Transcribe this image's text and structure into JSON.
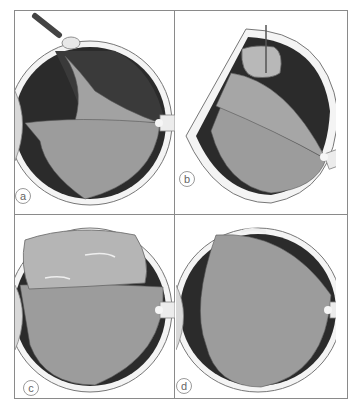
{
  "figure": {
    "panels": [
      {
        "id": "a",
        "label": "a",
        "description": "Pneumatic retinopexy: gas injection with cryo probe at superior retinal break, detached retina"
      },
      {
        "id": "b",
        "label": "b",
        "description": "Needle injecting gas bubble into vitreous cavity, retina detached"
      },
      {
        "id": "c",
        "label": "c",
        "description": "Large gas bubble tamponading superior break, retina reattaching"
      },
      {
        "id": "d",
        "label": "d",
        "description": "Retina reattached; small residual scar at superior break"
      }
    ],
    "colors": {
      "frame": "#8a8a8a",
      "sclera": "#f2f2f2",
      "choroid_dark": "#2a2a2a",
      "retina": "#9a9a9a",
      "bubble": "#bdbdbd"
    }
  }
}
